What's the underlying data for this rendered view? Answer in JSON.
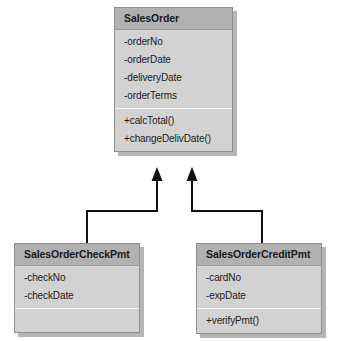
{
  "diagram": {
    "type": "uml-class-diagram",
    "background_color": "#ffffff",
    "class_header_color": "#b1b1b1",
    "class_body_color": "#d2d2d2",
    "connector_color": "#111111",
    "classes": [
      {
        "id": "salesorder",
        "name": "SalesOrder",
        "attributes": [
          "-orderNo",
          "-orderDate",
          "-deliveryDate",
          "-orderTerms"
        ],
        "operations": [
          "+calcTotal()",
          "+changeDelivDate()"
        ]
      },
      {
        "id": "salesordercheckpmt",
        "name": "SalesOrderCheckPmt",
        "attributes": [
          "-checkNo",
          "-checkDate"
        ],
        "operations": []
      },
      {
        "id": "salesordercreditpmt",
        "name": "SalesOrderCreditPmt",
        "attributes": [
          "-cardNo",
          "-expDate"
        ],
        "operations": [
          "+verifyPmt()"
        ]
      }
    ],
    "relationships": [
      {
        "id": "gen-check",
        "type": "generalization",
        "from": "SalesOrderCheckPmt",
        "to": "SalesOrder",
        "arrow": "filled-arrow"
      },
      {
        "id": "gen-credit",
        "type": "generalization",
        "from": "SalesOrderCreditPmt",
        "to": "SalesOrder",
        "arrow": "filled-arrow"
      }
    ]
  }
}
